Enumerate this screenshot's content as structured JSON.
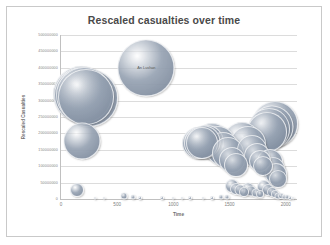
{
  "chart_data": {
    "type": "scatter",
    "title": "Rescaled casualties over time",
    "xlabel": "Time",
    "ylabel": "Rescaled Casualties",
    "xlim": [
      0,
      2100
    ],
    "ylim": [
      0,
      500000000
    ],
    "grid": true,
    "legend": "none",
    "xticks": [
      "0",
      "500",
      "1000",
      "1500",
      "2000"
    ],
    "xtick_values": [
      0,
      500,
      1000,
      1500,
      2000
    ],
    "yticks": [
      "0",
      "50000000",
      "100000000",
      "150000000",
      "200000000",
      "250000000",
      "300000000",
      "350000000",
      "400000000",
      "450000000",
      "500000000"
    ],
    "ytick_values": [
      0,
      50000000,
      100000000,
      150000000,
      200000000,
      250000000,
      300000000,
      350000000,
      400000000,
      450000000,
      500000000
    ],
    "points": [
      {
        "x": 175,
        "y": 320000000,
        "size": 56,
        "label": ""
      },
      {
        "x": 190,
        "y": 318000000,
        "size": 56,
        "label": ""
      },
      {
        "x": 205,
        "y": 316000000,
        "size": 56,
        "label": ""
      },
      {
        "x": 225,
        "y": 312000000,
        "size": 56,
        "label": ""
      },
      {
        "x": 250,
        "y": 308000000,
        "size": 58,
        "label": ""
      },
      {
        "x": 760,
        "y": 398000000,
        "size": 57,
        "label": "An Lushan"
      },
      {
        "x": 185,
        "y": 176000000,
        "size": 37,
        "label": ""
      },
      {
        "x": 145,
        "y": 28000000,
        "size": 14,
        "label": ""
      },
      {
        "x": 1215,
        "y": 172000000,
        "size": 32,
        "label": ""
      },
      {
        "x": 1235,
        "y": 172000000,
        "size": 32,
        "label": ""
      },
      {
        "x": 1255,
        "y": 172000000,
        "size": 32,
        "label": ""
      },
      {
        "x": 1275,
        "y": 173000000,
        "size": 33,
        "label": ""
      },
      {
        "x": 1300,
        "y": 174000000,
        "size": 34,
        "label": "Mongol\nConquests"
      },
      {
        "x": 1345,
        "y": 176000000,
        "size": 36,
        "label": ""
      },
      {
        "x": 1400,
        "y": 168000000,
        "size": 36,
        "label": ""
      },
      {
        "x": 1440,
        "y": 152000000,
        "size": 34,
        "label": ""
      },
      {
        "x": 1490,
        "y": 140000000,
        "size": 32,
        "label": ""
      },
      {
        "x": 1520,
        "y": 120000000,
        "size": 26,
        "label": ""
      },
      {
        "x": 1560,
        "y": 104000000,
        "size": 24,
        "label": ""
      },
      {
        "x": 1610,
        "y": 178000000,
        "size": 38,
        "label": ""
      },
      {
        "x": 1660,
        "y": 168000000,
        "size": 36,
        "label": ""
      },
      {
        "x": 1700,
        "y": 150000000,
        "size": 30,
        "label": ""
      },
      {
        "x": 1740,
        "y": 132000000,
        "size": 26,
        "label": ""
      },
      {
        "x": 1770,
        "y": 116000000,
        "size": 22,
        "label": ""
      },
      {
        "x": 1795,
        "y": 100000000,
        "size": 20,
        "label": ""
      },
      {
        "x": 1830,
        "y": 205000000,
        "size": 40,
        "label": ""
      },
      {
        "x": 1855,
        "y": 212000000,
        "size": 42,
        "label": ""
      },
      {
        "x": 1880,
        "y": 218000000,
        "size": 43,
        "label": ""
      },
      {
        "x": 1905,
        "y": 228000000,
        "size": 46,
        "label": "WWII"
      },
      {
        "x": 1860,
        "y": 112000000,
        "size": 26,
        "label": ""
      },
      {
        "x": 1890,
        "y": 92000000,
        "size": 24,
        "label": ""
      },
      {
        "x": 1915,
        "y": 76000000,
        "size": 22,
        "label": ""
      },
      {
        "x": 1935,
        "y": 62000000,
        "size": 18,
        "label": ""
      },
      {
        "x": 1520,
        "y": 40000000,
        "size": 14,
        "label": ""
      },
      {
        "x": 1555,
        "y": 32000000,
        "size": 12,
        "label": ""
      },
      {
        "x": 1590,
        "y": 26000000,
        "size": 11,
        "label": ""
      },
      {
        "x": 1625,
        "y": 22000000,
        "size": 10,
        "label": ""
      },
      {
        "x": 1660,
        "y": 30000000,
        "size": 13,
        "label": ""
      },
      {
        "x": 1695,
        "y": 24000000,
        "size": 11,
        "label": ""
      },
      {
        "x": 1735,
        "y": 18000000,
        "size": 9,
        "label": ""
      },
      {
        "x": 1775,
        "y": 16000000,
        "size": 8,
        "label": ""
      },
      {
        "x": 1810,
        "y": 36000000,
        "size": 14,
        "label": ""
      },
      {
        "x": 1845,
        "y": 28000000,
        "size": 12,
        "label": ""
      },
      {
        "x": 1875,
        "y": 20000000,
        "size": 10,
        "label": ""
      },
      {
        "x": 1905,
        "y": 14000000,
        "size": 8,
        "label": ""
      },
      {
        "x": 1935,
        "y": 10000000,
        "size": 7,
        "label": ""
      },
      {
        "x": 1960,
        "y": 8000000,
        "size": 6,
        "label": ""
      },
      {
        "x": 1985,
        "y": 6000000,
        "size": 5,
        "label": ""
      },
      {
        "x": 2010,
        "y": 5000000,
        "size": 5,
        "label": ""
      },
      {
        "x": 2035,
        "y": 4000000,
        "size": 4,
        "label": ""
      },
      {
        "x": 560,
        "y": 9000000,
        "size": 7,
        "label": ""
      },
      {
        "x": 640,
        "y": 5000000,
        "size": 5,
        "label": ""
      },
      {
        "x": 700,
        "y": 3000000,
        "size": 4,
        "label": ""
      },
      {
        "x": 900,
        "y": 4000000,
        "size": 4,
        "label": ""
      },
      {
        "x": 1000,
        "y": 3000000,
        "size": 3,
        "label": ""
      },
      {
        "x": 1080,
        "y": 3000000,
        "size": 3,
        "label": ""
      },
      {
        "x": 1150,
        "y": 4000000,
        "size": 4,
        "label": ""
      },
      {
        "x": 1260,
        "y": 3000000,
        "size": 3,
        "label": ""
      },
      {
        "x": 1340,
        "y": 4000000,
        "size": 4,
        "label": ""
      },
      {
        "x": 1420,
        "y": 5000000,
        "size": 5,
        "label": ""
      },
      {
        "x": 300,
        "y": 2000000,
        "size": 3,
        "label": ""
      },
      {
        "x": 380,
        "y": 2000000,
        "size": 3,
        "label": ""
      },
      {
        "x": 1480,
        "y": 6000000,
        "size": 5,
        "label": ""
      },
      {
        "x": 2060,
        "y": 3000000,
        "size": 3,
        "label": ""
      }
    ]
  }
}
